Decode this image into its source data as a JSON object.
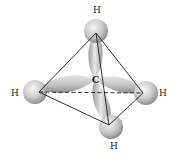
{
  "diagram": {
    "center_atom": {
      "label": "C",
      "x": 95,
      "y": 80
    },
    "atoms": [
      {
        "label": "H",
        "position": "top",
        "label_x": 96,
        "label_y": 13,
        "x": 96,
        "y": 31
      },
      {
        "label": "H",
        "position": "left",
        "label_x": 14,
        "label_y": 96,
        "x": 35,
        "y": 92
      },
      {
        "label": "H",
        "position": "right",
        "label_x": 162,
        "label_y": 96,
        "x": 146,
        "y": 93
      },
      {
        "label": "H",
        "position": "bottom",
        "label_x": 113,
        "label_y": 149,
        "x": 111,
        "y": 127
      }
    ],
    "edges": {
      "solid": [
        [
          "top",
          "left"
        ],
        [
          "top",
          "right"
        ],
        [
          "top",
          "bottom"
        ],
        [
          "left",
          "bottom"
        ],
        [
          "right",
          "bottom"
        ]
      ],
      "dashed": [
        [
          "left",
          "right"
        ]
      ]
    },
    "colors": {
      "sphere_light": "#f2f2f2",
      "sphere_dark": "#9a9a9a",
      "orbital_light": "#e6e6e6",
      "orbital_dark": "#8f8f8f",
      "line": "#1a1a1a",
      "text": "#222222"
    }
  }
}
